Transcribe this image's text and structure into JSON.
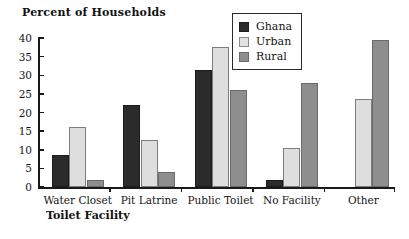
{
  "chart_data": {
    "type": "bar",
    "title": "",
    "ylabel": "Percent of Households",
    "xlabel": "Toilet Facility",
    "categories": [
      "Water Closet",
      "Pit Latrine",
      "Public Toilet",
      "No Facility",
      "Other"
    ],
    "series": [
      {
        "name": "Ghana",
        "color": "#2b2b2b",
        "values": [
          8.5,
          22.0,
          31.5,
          2.0,
          0.0
        ]
      },
      {
        "name": "Urban",
        "color": "#dedede",
        "values": [
          16.0,
          12.5,
          37.5,
          10.5,
          23.5
        ]
      },
      {
        "name": "Rural",
        "color": "#8e8e8e",
        "values": [
          2.0,
          4.0,
          26.0,
          28.0,
          39.5
        ]
      }
    ],
    "ylim": [
      0,
      40
    ],
    "yticks": [
      0,
      5,
      10,
      15,
      20,
      25,
      30,
      35,
      40
    ],
    "ytick_labels": [
      "0",
      "5",
      "10",
      "15",
      "20",
      "25",
      "30",
      "35",
      "40"
    ],
    "grid": false,
    "legend_position": "top-right"
  },
  "legend": {
    "items": [
      {
        "label": "Ghana"
      },
      {
        "label": "Urban"
      },
      {
        "label": "Rural"
      }
    ]
  }
}
